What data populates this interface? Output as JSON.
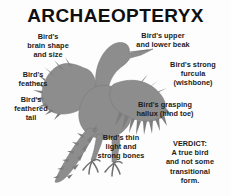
{
  "title": "ARCHAEOPTERYX",
  "figure": {
    "name": "archaeopteryx-silhouette",
    "fill_color": "#8d8d8d",
    "outline_color": "#6f6f6f"
  },
  "callouts": [
    {
      "id": "brain",
      "text": "Bird's\nbrain shape\nand size"
    },
    {
      "id": "feathers",
      "text": "Bird's\nfeathers"
    },
    {
      "id": "tail",
      "text": "Bird's\nfeathered\ntail"
    },
    {
      "id": "beak",
      "text": "Bird's upper\nand lower beak"
    },
    {
      "id": "furcula",
      "text": "Bird's strong\nfurcula\n(wishbone)"
    },
    {
      "id": "hallux",
      "text": "Bird's grasping\nhallux (hind toe)"
    },
    {
      "id": "bones",
      "text": "Bird's thin\nlight and\nstrong bones"
    },
    {
      "id": "verdict",
      "text": "VERDICT:\nA true bird\nand not some\ntransitional\nform."
    }
  ],
  "background_color": "#fdfdfd",
  "text_color": "#1c1c1c"
}
